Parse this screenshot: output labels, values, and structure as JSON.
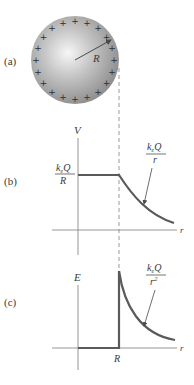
{
  "panels": {
    "a": {
      "label": "(a)",
      "radius_label": "R",
      "charge_sign": "+",
      "charge_count": 20
    },
    "b": {
      "label": "(b)",
      "y_axis_label": "V",
      "x_axis_label": "r",
      "plateau_label_num": "k_eQ",
      "plateau_label_den": "R",
      "curve_label_num": "k_eQ",
      "curve_label_den": "r"
    },
    "c": {
      "label": "(c)",
      "y_axis_label": "E",
      "x_axis_label": "r",
      "x_tick_label": "R",
      "curve_label_num": "k_eQ",
      "curve_label_den": "r",
      "curve_label_den_exp": "2"
    }
  },
  "colors": {
    "curve": "#5a5a5a",
    "axis": "#8a8a8a",
    "sphere_light": "#f4f4f4",
    "sphere_dark": "#8e8e8e",
    "dashed": "#9a9a9a"
  },
  "chart_data": [
    {
      "type": "line",
      "title": "(b) Electric potential of a charged conducting sphere",
      "xlabel": "r",
      "ylabel": "V",
      "series": [
        {
          "name": "inside (r < R)",
          "description": "constant V = k_eQ/R"
        },
        {
          "name": "outside (r > R)",
          "description": "V = k_eQ/r"
        }
      ],
      "annotations": [
        "k_eQ/R",
        "k_eQ/r"
      ]
    },
    {
      "type": "line",
      "title": "(c) Electric field of a charged conducting sphere",
      "xlabel": "r",
      "ylabel": "E",
      "x_ticks": [
        "R"
      ],
      "series": [
        {
          "name": "inside (r < R)",
          "description": "E = 0"
        },
        {
          "name": "outside (r > R)",
          "description": "E = k_eQ/r^2"
        }
      ],
      "annotations": [
        "k_eQ/r^2"
      ]
    }
  ]
}
